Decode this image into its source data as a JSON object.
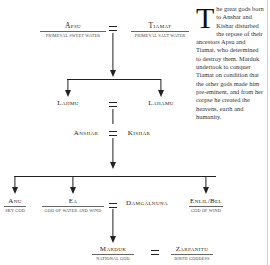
{
  "family_tree": {
    "generation_1": {
      "left": {
        "name": "Apsu",
        "epithet": "Primeval sweet water"
      },
      "right": {
        "name": "Tiamat",
        "epithet": "Primeval salt water"
      },
      "union_symbol": "="
    },
    "generation_2": {
      "left": {
        "name": "Lahmu"
      },
      "right": {
        "name": "Lahamu"
      },
      "union_symbol": "="
    },
    "generation_3": {
      "left": {
        "name": "Anshar"
      },
      "right": {
        "name": "Kishar"
      },
      "union_symbol": "="
    },
    "generation_4": {
      "children": [
        {
          "name": "Anu",
          "epithet": "Sky god"
        },
        {
          "name": "Ea",
          "epithet": "God of water and wind"
        },
        {
          "name": "Enlil/Bel",
          "epithet": "God of wind"
        }
      ],
      "spouse_of_ea": {
        "name": "Damgalnuna"
      },
      "union_symbol": "="
    },
    "generation_5": {
      "left": {
        "name": "Marduk",
        "epithet": "National god"
      },
      "right": {
        "name": "Zarpanitu",
        "epithet": "Birth goddess"
      },
      "union_symbol": "="
    }
  },
  "sidebar_text": {
    "drop_cap": "T",
    "body": "he great gods born to Anshar and Kishar disturbed the repose of their ancestors Apsu and Tiamat, who determined to destroy them. Marduk undertook to conquer Tiamat on condition that the other gods made him pre-eminent, and from her corpse he created the heavens, earth and humanity."
  }
}
